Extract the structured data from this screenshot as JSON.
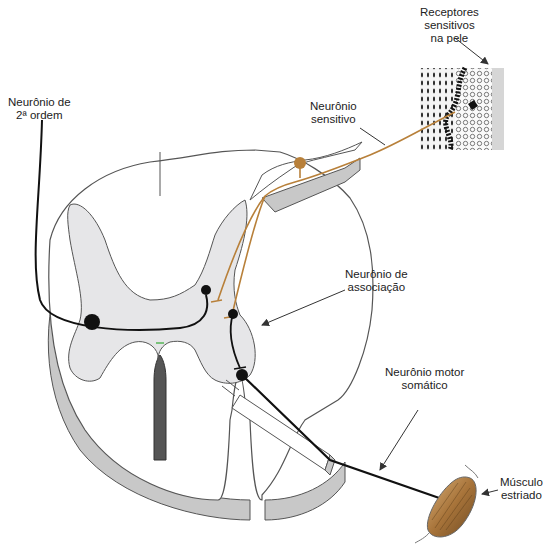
{
  "diagram": {
    "colors": {
      "sensory_neuron": "#b8803a",
      "motor_neuron": "#111111",
      "gray_matter": "#e6e6e8",
      "cord_outline": "#555555",
      "cord_shadow": "#c8c8c8",
      "muscle": "#a8743a"
    }
  },
  "labels": {
    "second_order": {
      "line1": "Neurônio de",
      "line2": "2ª ordem"
    },
    "receptors": {
      "line1": "Receptores",
      "line2": "sensitivos",
      "line3": "na pele"
    },
    "sensory": {
      "line1": "Neurônio",
      "line2": "sensitivo"
    },
    "association": {
      "line1": "Neurônio de",
      "line2": "associação"
    },
    "motor": {
      "line1": "Neurônio motor",
      "line2": "somático"
    },
    "muscle": {
      "line1": "Músculo",
      "line2": "estriado"
    }
  }
}
